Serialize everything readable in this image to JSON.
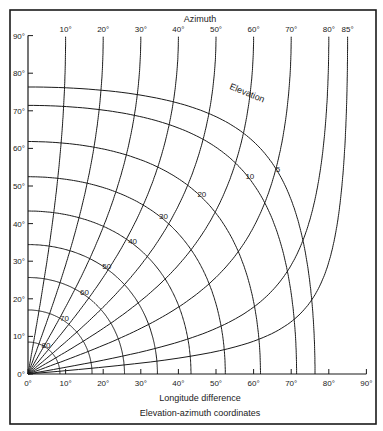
{
  "chart_data": {
    "type": "line",
    "title": "Elevation-azimuth coordinates",
    "xlabel": "Longitude difference",
    "ylabel": "",
    "top_axis_label": "Azimuth",
    "curve_family_label": "Elevation",
    "xlim": [
      0,
      90
    ],
    "ylim": [
      0,
      90
    ],
    "x_ticks": [
      "0°",
      "10°",
      "20°",
      "30°",
      "40°",
      "50°",
      "60°",
      "70°",
      "80°",
      "90°"
    ],
    "y_ticks": [
      "0°",
      "10°",
      "20°",
      "30°",
      "40°",
      "50°",
      "60°",
      "70°",
      "80°",
      "90°"
    ],
    "azimuth_curves": [
      10,
      20,
      30,
      40,
      50,
      60,
      70,
      80,
      85
    ],
    "azimuth_labels": [
      "10°",
      "20°",
      "30°",
      "40°",
      "50°",
      "60°",
      "70°",
      "80°",
      "85°"
    ],
    "elevation_curves": [
      5,
      10,
      20,
      30,
      40,
      50,
      60,
      70,
      80
    ],
    "elevation_labels": [
      "5",
      "10",
      "20",
      "30",
      "40",
      "50",
      "60",
      "70",
      "80"
    ],
    "grid": false,
    "legend": "none",
    "model": {
      "source": "assumed, not read from the figure",
      "note": "Curve shapes are generated from geostationary-satellite look-angle equations (station latitude on y, longitude difference on x). This model was chosen to fit the chart; it matches the 5° elevation intercepts (~76° on both axes) and the azimuth curves meeting the top edge at their labelled longitude, but it has not been verified against every curve in the original.",
      "equations": {
        "central_angle": "cos(beta) = cos(lat) * cos(dlon)",
        "elevation": "El = atan((cos(beta) - 0.1513) / sin(beta))",
        "azimuth": "Az = atan(tan(dlon) / sin(lat))"
      },
      "earth_radius_ratio": 0.1513
    }
  },
  "colors": {
    "ink": "#1a1a1a",
    "background": "#ffffff"
  }
}
